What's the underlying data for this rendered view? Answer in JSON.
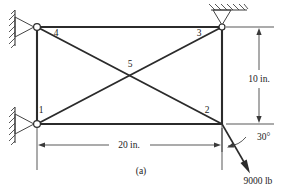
{
  "figure": {
    "caption": "(a)",
    "type": "truss-free-body-diagram"
  },
  "nodes": [
    {
      "id": "1",
      "label": "1",
      "x": 37,
      "y": 124,
      "label_x": 41,
      "label_y": 113
    },
    {
      "id": "2",
      "label": "2",
      "x": 222,
      "y": 124,
      "label_x": 207,
      "label_y": 113
    },
    {
      "id": "3",
      "label": "3",
      "x": 222,
      "y": 27,
      "label_x": 199,
      "label_y": 36
    },
    {
      "id": "4",
      "label": "4",
      "x": 37,
      "y": 27,
      "label_x": 56,
      "label_y": 36
    },
    {
      "id": "5",
      "label": "5",
      "x": 129,
      "y": 75,
      "label_x": 130,
      "label_y": 67
    }
  ],
  "members": [
    {
      "name": "top-chord",
      "from": "4",
      "to": "3"
    },
    {
      "name": "bottom-chord",
      "from": "1",
      "to": "2"
    },
    {
      "name": "left-post",
      "from": "1",
      "to": "4"
    },
    {
      "name": "right-post",
      "from": "2",
      "to": "3"
    },
    {
      "name": "diagonal-4-2",
      "from": "4",
      "to": "2"
    },
    {
      "name": "diagonal-1-3",
      "from": "1",
      "to": "3"
    }
  ],
  "supports": [
    {
      "name": "support-top-left",
      "kind": "pin-wall-vertical",
      "x": 37,
      "y": 27
    },
    {
      "name": "support-bottom-left",
      "kind": "pin-wall-vertical",
      "x": 37,
      "y": 124
    },
    {
      "name": "support-top-right",
      "kind": "pin-wall-horizontal",
      "x": 222,
      "y": 27
    }
  ],
  "dimensions": {
    "horizontal": {
      "label": "20 in.",
      "value": 20,
      "units": "in.",
      "label_x": 129,
      "label_y": 148
    },
    "vertical": {
      "label": "10 in.",
      "value": 10,
      "units": "in.",
      "label_x": 259,
      "label_y": 79
    }
  },
  "load": {
    "magnitude_label": "9000 lb",
    "magnitude": 9000,
    "units": "lb",
    "angle_label": "30°",
    "angle_degrees": 30,
    "applied_at_node": "2",
    "magnitude_label_x": 258,
    "magnitude_label_y": 183,
    "angle_label_x": 257,
    "angle_label_y": 140
  },
  "colors": {
    "member": "#2b2b2b",
    "thin_line": "#3a3a3a",
    "background": "#ffffff",
    "text": "#1a1a1a"
  }
}
